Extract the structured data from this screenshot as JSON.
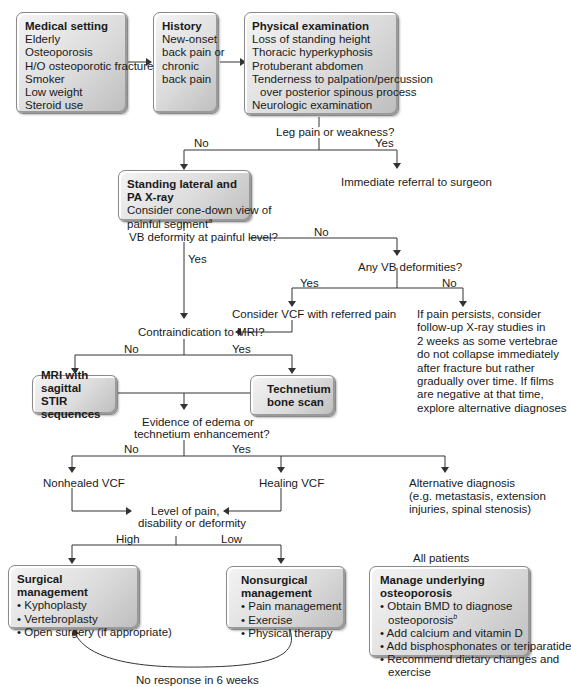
{
  "boxes": {
    "medical_setting": {
      "title": "Medical setting",
      "items": [
        "Elderly",
        "Osteoporosis",
        "H/O osteoporotic fracture",
        "Smoker",
        "Low weight",
        "Steroid use"
      ]
    },
    "history": {
      "title": "History",
      "items": [
        "New-onset",
        "back pain or",
        "chronic",
        "back pain"
      ]
    },
    "physical_exam": {
      "title": "Physical examination",
      "items": [
        "Loss of standing height",
        "Thoracic hyperkyphosis",
        "Protuberant abdomen",
        "Tenderness to palpation/percussion",
        "over posterior spinous process",
        "Neurologic examination"
      ]
    },
    "xray": {
      "title": "Standing lateral and PA X-ray",
      "items": [
        "Consider cone-down view of",
        "painful segment"
      ],
      "footnote": "a"
    },
    "mri": {
      "title_lines": [
        "MRI with sagittal",
        "STIR sequences"
      ]
    },
    "technetium": {
      "title_lines": [
        "Technetium",
        "bone scan"
      ]
    },
    "surgical": {
      "title": "Surgical management",
      "items": [
        "• Kyphoplasty",
        "• Vertebroplasty",
        "• Open surgery (if appropriate)"
      ]
    },
    "nonsurgical": {
      "title": "Nonsurgical management",
      "items": [
        "• Pain management",
        "• Exercise",
        "• Physical therapy"
      ]
    },
    "osteoporosis": {
      "title": "Manage underlying osteoporosis",
      "items": [
        "• Obtain BMD to diagnose",
        "osteoporosis",
        "• Add calcium and vitamin D",
        "• Add bisphosphonates or teriparatide",
        "• Recommend dietary changes and",
        "exercise"
      ],
      "footnote": "b"
    }
  },
  "questions": {
    "leg_pain": "Leg pain or weakness?",
    "vb_deformity_painful": "VB deformity at painful level?",
    "any_vb": "Any VB deformities?",
    "contraindication_mri": "Contraindication to MRI?",
    "edema": [
      "Evidence of edema or",
      "technetium enhancement?"
    ],
    "level_pain": [
      "Level of pain,",
      "disability or deformity"
    ]
  },
  "outcomes": {
    "immediate_referral": "Immediate referral to surgeon",
    "consider_vcf": "Consider VCF with referred pain",
    "pain_persists": [
      "If pain persists, consider",
      "follow-up X-ray studies in",
      "2 weeks as some vertebrae",
      "do not collapse immediately",
      "after fracture but rather",
      "gradually over time. If films",
      "are negative at that time,",
      "explore alternative diagnoses"
    ],
    "nonhealed_vcf": "Nonhealed VCF",
    "healing_vcf": "Healing VCF",
    "alternative_dx": [
      "Alternative diagnosis",
      "(e.g. metastasis, extension",
      "injuries, spinal stenosis)"
    ],
    "all_patients": "All patients",
    "no_response": "No response in 6 weeks"
  },
  "branch_labels": {
    "leg_no": "No",
    "leg_yes": "Yes",
    "vb_no": "No",
    "vb_yes": "Yes",
    "any_yes": "Yes",
    "any_no": "No",
    "mri_no": "No",
    "mri_yes": "Yes",
    "edema_no": "No",
    "edema_yes": "Yes",
    "level_high": "High",
    "level_low": "Low"
  },
  "colors": {
    "box_light": "#f4f4f4",
    "box_dark": "#bdbdbd",
    "line": "#333333"
  }
}
